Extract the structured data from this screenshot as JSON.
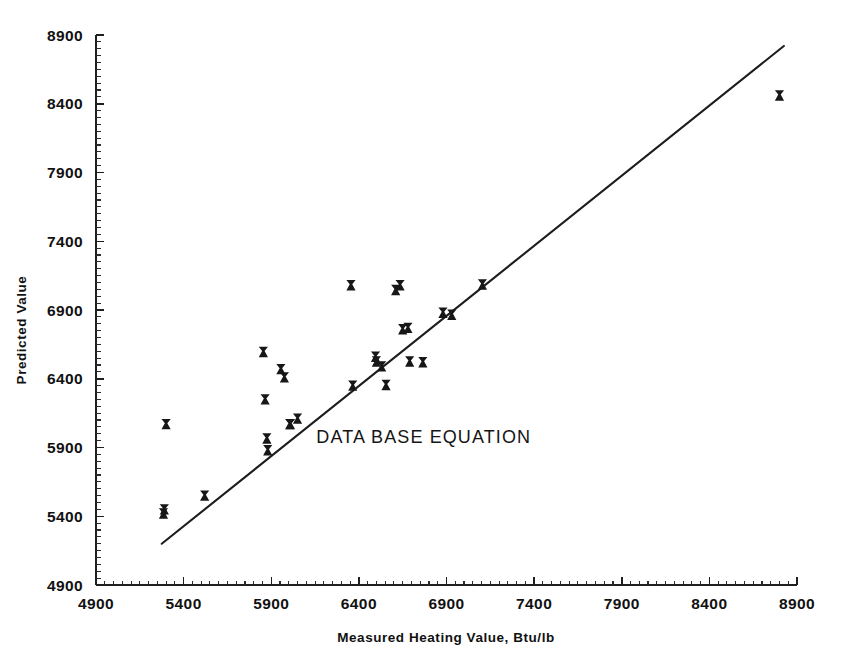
{
  "chart_data": {
    "type": "scatter",
    "title": "",
    "xlabel": "Measured Heating Value, Btu/lb",
    "ylabel": "Predicted Value",
    "xlim": [
      4900,
      8900
    ],
    "ylim": [
      4900,
      8900
    ],
    "xticks": [
      4900,
      5400,
      5900,
      6400,
      6900,
      7400,
      7900,
      8400,
      8900
    ],
    "yticks": [
      4900,
      5400,
      5900,
      6400,
      6900,
      7400,
      7900,
      8400,
      8900
    ],
    "xtick_labels": [
      "4900",
      "5400",
      "5900",
      "6400",
      "6900",
      "7400",
      "7900",
      "8400",
      "8900"
    ],
    "ytick_labels": [
      "4900",
      "5400",
      "5900",
      "6400",
      "6900",
      "7400",
      "7900",
      "8400",
      "8900"
    ],
    "minor_ticks_per_interval": 10,
    "grid": false,
    "legend": null,
    "marker_style": "x",
    "marker_color": "#171717",
    "line_color": "#1d1d1d",
    "annotations": [
      {
        "text": "DATA BASE EQUATION",
        "x": 6770,
        "y": 5935
      }
    ],
    "fit_line": {
      "label": "data base equation fit line",
      "x_start": 5275,
      "y_start": 5200,
      "x_end": 8825,
      "y_end": 8820
    },
    "series": [
      {
        "name": "Samples",
        "points": [
          {
            "x": 5290,
            "y": 5450
          },
          {
            "x": 5285,
            "y": 5420
          },
          {
            "x": 5300,
            "y": 6070
          },
          {
            "x": 5520,
            "y": 5550
          },
          {
            "x": 5855,
            "y": 6595
          },
          {
            "x": 5865,
            "y": 6250
          },
          {
            "x": 5875,
            "y": 5965
          },
          {
            "x": 5880,
            "y": 5880
          },
          {
            "x": 5955,
            "y": 6470
          },
          {
            "x": 5975,
            "y": 6410
          },
          {
            "x": 6005,
            "y": 6070
          },
          {
            "x": 6010,
            "y": 6070
          },
          {
            "x": 6050,
            "y": 6110
          },
          {
            "x": 6355,
            "y": 7080
          },
          {
            "x": 6365,
            "y": 6350
          },
          {
            "x": 6495,
            "y": 6560
          },
          {
            "x": 6500,
            "y": 6525
          },
          {
            "x": 6530,
            "y": 6490
          },
          {
            "x": 6555,
            "y": 6355
          },
          {
            "x": 6610,
            "y": 7045
          },
          {
            "x": 6635,
            "y": 7080
          },
          {
            "x": 6650,
            "y": 6760
          },
          {
            "x": 6680,
            "y": 6770
          },
          {
            "x": 6690,
            "y": 6525
          },
          {
            "x": 6765,
            "y": 6520
          },
          {
            "x": 6880,
            "y": 6880
          },
          {
            "x": 6930,
            "y": 6865
          },
          {
            "x": 7105,
            "y": 7085
          },
          {
            "x": 8800,
            "y": 8460
          }
        ]
      }
    ]
  },
  "axes": {
    "y_axis_label": "Predicted Value",
    "x_axis_label": "Measured Heating Value, Btu/lb"
  },
  "annotation": {
    "data_base_equation": "DATA BASE EQUATION"
  }
}
